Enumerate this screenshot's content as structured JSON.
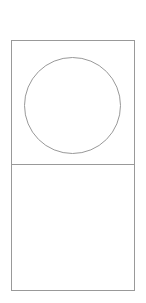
{
  "figure": {
    "canvas": {
      "width": 146,
      "height": 303,
      "background": "#ffffff"
    },
    "stroke": {
      "color": "#999999",
      "width": 1
    },
    "panel": {
      "name": "outer-rectangle",
      "x": 11.5,
      "y": 40.5,
      "width": 123,
      "height": 250,
      "fill": "#ffffff"
    },
    "divider": {
      "name": "horizontal-divider",
      "x1": 11.5,
      "y1": 164.5,
      "x2": 134.5,
      "y2": 164.5
    },
    "cells": [
      {
        "name": "upper-cell",
        "contents": "circle",
        "label": ""
      },
      {
        "name": "lower-cell",
        "contents": "empty",
        "label": ""
      }
    ],
    "circle": {
      "name": "circle-outline",
      "cx": 72.5,
      "cy": 105.5,
      "r": 48,
      "fill": "#ffffff"
    }
  }
}
